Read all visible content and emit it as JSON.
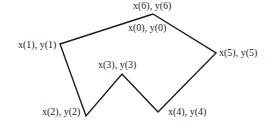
{
  "figure": {
    "type": "polygon",
    "stroke_color": "#1a1a1a",
    "stroke_width": 1.4,
    "vertices": [
      {
        "id": "p0",
        "x": 153,
        "y": 14
      },
      {
        "id": "p1",
        "x": 60,
        "y": 44
      },
      {
        "id": "p2",
        "x": 86,
        "y": 116
      },
      {
        "id": "p3",
        "x": 122,
        "y": 74
      },
      {
        "id": "p4",
        "x": 158,
        "y": 112
      },
      {
        "id": "p5",
        "x": 216,
        "y": 53
      },
      {
        "id": "p6",
        "x": 153,
        "y": 14
      }
    ],
    "points_attr": "153,14 60,44 86,116 122,74 158,112 216,53 153,14"
  },
  "labels": {
    "p6": "x(6), y(6)",
    "p0": "x(0), y(0)",
    "p1": "x(1), y(1)",
    "p2": "x(2), y(2)",
    "p3": "x(3), y(3)",
    "p4": "x(4), y(4)",
    "p5": "x(5), y(5)"
  }
}
